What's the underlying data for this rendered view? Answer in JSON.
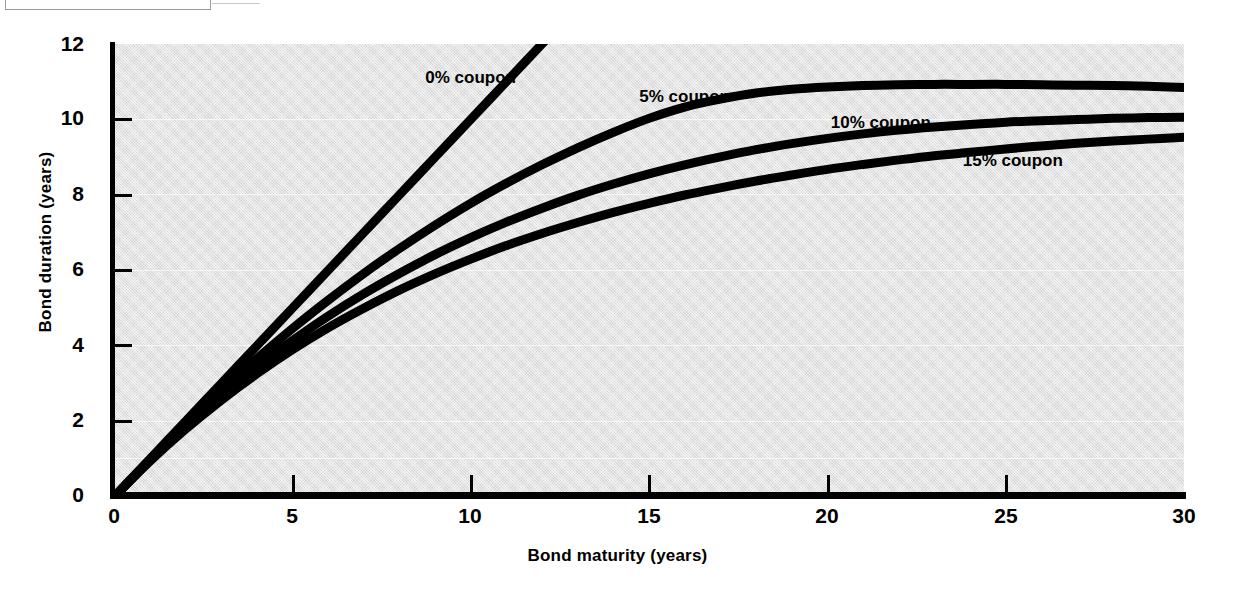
{
  "figure": {
    "caption_box_present": true
  },
  "chart_data": {
    "type": "line",
    "title": "",
    "xlabel": "Bond maturity (years)",
    "ylabel": "Bond duration (years)",
    "xlim": [
      0,
      30
    ],
    "ylim": [
      0,
      12
    ],
    "xticks": [
      "0",
      "5",
      "10",
      "15",
      "20",
      "25",
      "30"
    ],
    "yticks": [
      "0",
      "2",
      "4",
      "6",
      "8",
      "10",
      "12"
    ],
    "grid": false,
    "legend_position": "inline-annotations",
    "x": [
      0,
      1,
      2,
      3,
      4,
      5,
      6,
      7,
      8,
      9,
      10,
      11,
      12,
      13,
      14,
      15,
      16,
      17,
      18,
      19,
      20,
      21,
      22,
      23,
      24,
      25,
      26,
      27,
      28,
      29,
      30
    ],
    "series": [
      {
        "name": "0% coupon",
        "label": "0% coupon",
        "label_x": 10.0,
        "label_y": 11.1,
        "color": "#000000",
        "clipped_at_top": true,
        "values": [
          0,
          1,
          2,
          3,
          4,
          5,
          6,
          7,
          8,
          9,
          10,
          11,
          12,
          13,
          14,
          15,
          16,
          17,
          18,
          19,
          20,
          21,
          22,
          23,
          24,
          25,
          26,
          27,
          28,
          29,
          30
        ]
      },
      {
        "name": "5% coupon",
        "label": "5% coupon",
        "label_x": 16.0,
        "label_y": 10.6,
        "color": "#000000",
        "values": [
          0,
          0.98,
          1.92,
          2.81,
          3.66,
          4.46,
          5.21,
          5.92,
          6.58,
          7.2,
          7.78,
          8.31,
          8.8,
          9.25,
          9.66,
          10.03,
          10.33,
          10.54,
          10.7,
          10.8,
          10.86,
          10.9,
          10.92,
          10.93,
          10.93,
          10.93,
          10.92,
          10.91,
          10.9,
          10.88,
          10.85
        ]
      },
      {
        "name": "10% coupon",
        "label": "10% coupon",
        "label_x": 21.5,
        "label_y": 9.9,
        "color": "#000000",
        "values": [
          0,
          0.96,
          1.85,
          2.68,
          3.44,
          4.14,
          4.79,
          5.38,
          5.92,
          6.42,
          6.87,
          7.28,
          7.65,
          7.99,
          8.29,
          8.56,
          8.8,
          9.01,
          9.2,
          9.36,
          9.5,
          9.62,
          9.72,
          9.8,
          9.87,
          9.93,
          9.97,
          10.0,
          10.03,
          10.05,
          10.06
        ]
      },
      {
        "name": "15% coupon",
        "label": "15% coupon",
        "label_x": 25.2,
        "label_y": 8.9,
        "color": "#000000",
        "values": [
          0,
          0.94,
          1.79,
          2.56,
          3.26,
          3.9,
          4.48,
          5.0,
          5.48,
          5.91,
          6.3,
          6.66,
          6.98,
          7.27,
          7.54,
          7.78,
          8.0,
          8.19,
          8.37,
          8.53,
          8.68,
          8.81,
          8.93,
          9.04,
          9.13,
          9.22,
          9.3,
          9.37,
          9.43,
          9.48,
          9.53
        ]
      }
    ]
  }
}
